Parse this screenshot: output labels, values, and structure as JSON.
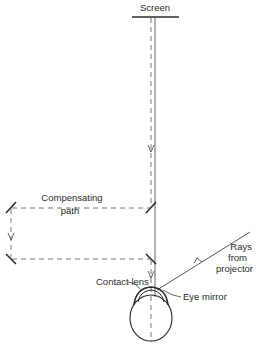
{
  "diagram": {
    "labels": {
      "screen": "Screen",
      "compensating_line1": "Compensating",
      "compensating_line2": "path",
      "rays_line1": "Rays",
      "rays_line2": "from",
      "rays_line3": "projector",
      "contact_lens": "Contact lens",
      "eye_mirror": "Eye mirror"
    },
    "colors": {
      "line": "#2a2a2a",
      "dashed": "#555555",
      "background": "#ffffff"
    }
  }
}
